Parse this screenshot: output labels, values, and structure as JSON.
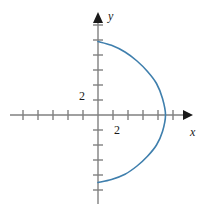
{
  "figure": {
    "width": 215,
    "height": 214,
    "background": "#ffffff"
  },
  "axes": {
    "x_axis_label": "x",
    "y_axis_label": "y",
    "x_tick_label": "2",
    "y_tick_label": "2",
    "axis_color": "#808080",
    "arrow_color": "#1a1a1a",
    "origin_px": {
      "x": 98,
      "y": 115
    },
    "tick_spacing_px": 15,
    "x_line": {
      "x1": 10,
      "x2": 190,
      "y": 115
    },
    "y_line": {
      "y1": 15,
      "y2": 205,
      "x": 98
    },
    "x_ticks_px": [
      23,
      38,
      53,
      68,
      83,
      113,
      128,
      143,
      158,
      173
    ],
    "y_ticks_px": [
      25,
      40,
      55,
      70,
      85,
      100,
      130,
      145,
      160,
      175,
      190
    ],
    "tick_half_len_px": 5
  },
  "chart_data": {
    "type": "line",
    "title": "",
    "xlabel": "x",
    "ylabel": "y",
    "grid": false,
    "legend": null,
    "xlim": [
      -6,
      6
    ],
    "ylim": [
      -6.5,
      6.5
    ],
    "xticks": [
      -5,
      -4,
      -3,
      -2,
      -1,
      1,
      2,
      3,
      4,
      5
    ],
    "yticks": [
      -5,
      -4,
      -3,
      -2,
      -1,
      1,
      2,
      3,
      4,
      5,
      6
    ],
    "xtick_labels_shown": [
      "2"
    ],
    "ytick_labels_shown": [
      "2"
    ],
    "series": [
      {
        "name": "right-opening semicircular arc",
        "color": "#3f7fad",
        "linewidth": 1.6,
        "description": "Semicircle of radius 4.5 centered at the origin, drawn for x >= 0; endpoints on the y-axis at (0, 4.9) and (0, -4.5), rightmost point at (4.5, 0).",
        "x": [
          0.0,
          0.9,
          1.8,
          2.6,
          3.3,
          3.9,
          4.3,
          4.5,
          4.3,
          3.9,
          3.3,
          2.6,
          1.8,
          0.9,
          0.0
        ],
        "y": [
          4.9,
          4.65,
          4.2,
          3.6,
          2.9,
          2.1,
          1.1,
          0.0,
          -1.1,
          -2.0,
          -2.75,
          -3.4,
          -3.95,
          -4.3,
          -4.5
        ]
      }
    ]
  },
  "curve_path": {
    "d": "M 98 42 C 128 44 152 62 161 84 C 165 95 166 106 165 115 C 164 127 161 140 154 152 C 143 170 122 181 98 182",
    "stroke": "#3f7fad",
    "stroke_width": 1.6
  }
}
